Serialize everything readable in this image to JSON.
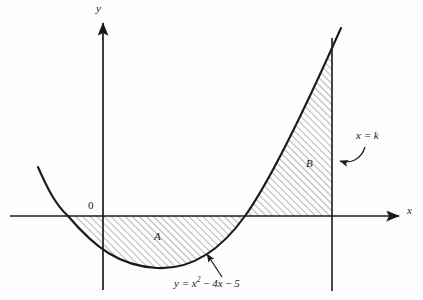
{
  "figure": {
    "background_color": "#fdfdfd",
    "ink_color": "#1a1a1a",
    "hatch_color": "#555555"
  },
  "axes": {
    "y_label": "y",
    "x_label": "x",
    "origin_label": "0"
  },
  "labels": {
    "region_a": "A",
    "region_b": "B",
    "vertical_line": "x = k",
    "curve_equation_html": "y = x<sup>2</sup> <span class=\"op\">−</span> 4x <span class=\"op\">−</span> 5",
    "curve_equation_text": "y = x² − 4x − 5"
  },
  "chart_data": {
    "type": "line",
    "xlabel": "x",
    "ylabel": "y",
    "curve_equation": "y = x^2 - 4x - 5",
    "coefficients": {
      "a": 1,
      "b": -4,
      "c": -5
    },
    "roots": [
      -1,
      5
    ],
    "vertex": {
      "x": 2,
      "y": -9
    },
    "y_intercept": -5,
    "vertical_line": {
      "label": "x = k",
      "type": "x = k"
    },
    "grid": false,
    "legend": false,
    "shaded_regions": [
      {
        "name": "A",
        "description": "Region between the curve and the x-axis from x = -1 to x = 5, below the axis",
        "hatched": true
      },
      {
        "name": "B",
        "description": "Region between the curve and the x-axis from x = 5 to x = k, above the axis",
        "hatched": true
      }
    ],
    "annotations": [
      {
        "text": "y = x² − 4x − 5",
        "target": "curve"
      },
      {
        "text": "x = k",
        "target": "vertical-line"
      },
      {
        "text": "A",
        "target": "region-a"
      },
      {
        "text": "B",
        "target": "region-b"
      },
      {
        "text": "0",
        "target": "origin"
      }
    ],
    "pixel_geometry": {
      "origin": {
        "x": 103,
        "y": 216
      },
      "x_axis_y": 216,
      "y_axis_x": 103,
      "root_left_px": 68,
      "root_right_px": 245,
      "vertex_px": {
        "x": 157,
        "y": 268
      },
      "line_k_px": 332,
      "curve_start_px": {
        "x": 38,
        "y": 167
      },
      "curve_end_px": {
        "x": 341,
        "y": 28
      }
    }
  }
}
